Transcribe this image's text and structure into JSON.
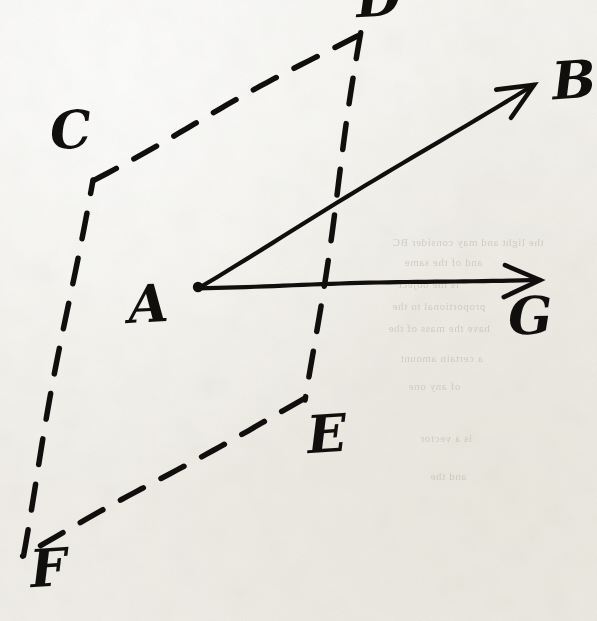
{
  "figure": {
    "medium": "ink on aged paper",
    "background_color": "#f4f3ee",
    "ink_color": "#100f0d",
    "width": 597,
    "height": 621
  },
  "labels": [
    {
      "id": "label-B",
      "text": "B",
      "x": 552,
      "y": 54,
      "size": 52,
      "rotate": -4
    },
    {
      "id": "label-D",
      "text": "D",
      "x": 356,
      "y": -28,
      "size": 52,
      "rotate": -3
    },
    {
      "id": "label-C",
      "text": "C",
      "x": 50,
      "y": 104,
      "size": 52,
      "rotate": -4
    },
    {
      "id": "label-A",
      "text": "A",
      "x": 128,
      "y": 278,
      "size": 52,
      "rotate": -3
    },
    {
      "id": "label-G",
      "text": "G",
      "x": 508,
      "y": 290,
      "size": 52,
      "rotate": -2
    },
    {
      "id": "label-E",
      "text": "E",
      "x": 307,
      "y": 408,
      "size": 52,
      "rotate": -4
    },
    {
      "id": "label-F",
      "text": "F",
      "x": 30,
      "y": 542,
      "size": 52,
      "rotate": -4
    }
  ],
  "points": [
    {
      "name": "A",
      "x": 198,
      "y": 287,
      "role": "vector-origin",
      "marked": true
    },
    {
      "name": "B",
      "x": 534,
      "y": 85,
      "role": "vector-head"
    },
    {
      "name": "G",
      "x": 540,
      "y": 280,
      "role": "vector-head"
    },
    {
      "name": "C",
      "x": 93,
      "y": 180,
      "role": "parallelogram-vertex"
    },
    {
      "name": "D",
      "x": 362,
      "y": 33,
      "role": "parallelogram-vertex"
    },
    {
      "name": "E",
      "x": 305,
      "y": 400,
      "role": "parallelogram-vertex"
    },
    {
      "name": "F",
      "x": 22,
      "y": 555,
      "role": "parallelogram-vertex"
    }
  ],
  "solid_vectors": [
    {
      "name": "vector-AB",
      "from": "A",
      "to": "B",
      "x1": 198,
      "y1": 287,
      "x2": 534,
      "y2": 85,
      "arrowhead": true
    },
    {
      "name": "vector-AG",
      "from": "A",
      "to": "G",
      "x1": 198,
      "y1": 287,
      "x2": 540,
      "y2": 280,
      "arrowhead": true
    }
  ],
  "dashed_edges": [
    {
      "name": "edge-CD",
      "from": "C",
      "to": "D",
      "x1": 93,
      "y1": 180,
      "x2": 362,
      "y2": 33
    },
    {
      "name": "edge-DE",
      "from": "D",
      "to": "E",
      "x1": 362,
      "y1": 33,
      "x2": 305,
      "y2": 400
    },
    {
      "name": "edge-EF",
      "from": "E",
      "to": "F",
      "x1": 305,
      "y1": 400,
      "x2": 22,
      "y2": 555
    },
    {
      "name": "edge-FC",
      "from": "F",
      "to": "C",
      "x1": 22,
      "y1": 555,
      "x2": 93,
      "y2": 180
    }
  ],
  "ghost_text": [
    {
      "text": "the light and may consider BC",
      "x": 392,
      "y": 236
    },
    {
      "text": "and of the same",
      "x": 404,
      "y": 256
    },
    {
      "text": "is the object",
      "x": 398,
      "y": 278
    },
    {
      "text": "proportional to the",
      "x": 392,
      "y": 300
    },
    {
      "text": "have the mass of the",
      "x": 388,
      "y": 322
    },
    {
      "text": "a certain amount",
      "x": 400,
      "y": 352
    },
    {
      "text": "of any one",
      "x": 408,
      "y": 380
    },
    {
      "text": "is a vector",
      "x": 420,
      "y": 432
    },
    {
      "text": "and the",
      "x": 430,
      "y": 470
    }
  ]
}
